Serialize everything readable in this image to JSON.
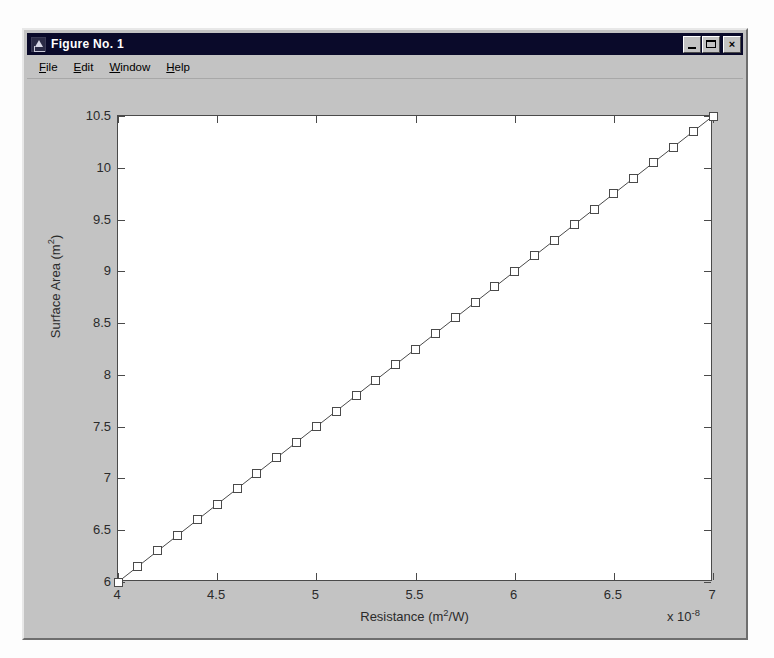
{
  "window": {
    "title": "Figure No. 1",
    "app_icon": "matlab-figure-icon",
    "buttons": {
      "minimize": "minimize-icon",
      "maximize": "maximize-icon",
      "close": "×"
    }
  },
  "menu": {
    "items": [
      {
        "label": "File",
        "mnemonic": "F"
      },
      {
        "label": "Edit",
        "mnemonic": "E"
      },
      {
        "label": "Window",
        "mnemonic": "W"
      },
      {
        "label": "Help",
        "mnemonic": "H"
      }
    ]
  },
  "colors": {
    "window_face": "#c3c3c3",
    "titlebar": "#0a0a2a",
    "titlebar_text": "#ffffff",
    "axes_background": "#ffffff",
    "axes_line": "#4a4a4a",
    "marker_edge": "#4a4a4a",
    "marker_face": "#ffffff",
    "line": "#4a4a4a"
  },
  "chart_data": {
    "type": "line",
    "title": "",
    "xlabel": "Resistance (m²/W)",
    "ylabel": "Surface Area (m²)",
    "x_multiplier": "x 10",
    "x_multiplier_exponent": "-8",
    "xlim": [
      4,
      7
    ],
    "ylim": [
      6,
      10.5
    ],
    "xticks": [
      4,
      4.5,
      5,
      5.5,
      6,
      6.5,
      7
    ],
    "xticklabels": [
      "4",
      "4.5",
      "5",
      "5.5",
      "6",
      "6.5",
      "7"
    ],
    "yticks": [
      6,
      6.5,
      7,
      7.5,
      8,
      8.5,
      9,
      9.5,
      10,
      10.5
    ],
    "yticklabels": [
      "6",
      "6.5",
      "7",
      "7.5",
      "8",
      "8.5",
      "9",
      "9.5",
      "10",
      "10.5"
    ],
    "grid": false,
    "legend": null,
    "marker": "square",
    "series": [
      {
        "name": "Surface Area vs Resistance",
        "x": [
          4.0,
          4.1,
          4.2,
          4.3,
          4.4,
          4.5,
          4.6,
          4.7,
          4.8,
          4.9,
          5.0,
          5.1,
          5.2,
          5.3,
          5.4,
          5.5,
          5.6,
          5.7,
          5.8,
          5.9,
          6.0,
          6.1,
          6.2,
          6.3,
          6.4,
          6.5,
          6.6,
          6.7,
          6.8,
          6.9,
          7.0
        ],
        "y": [
          6.0,
          6.15,
          6.3,
          6.45,
          6.6,
          6.75,
          6.9,
          7.05,
          7.2,
          7.35,
          7.5,
          7.65,
          7.8,
          7.95,
          8.1,
          8.25,
          8.4,
          8.55,
          8.7,
          8.85,
          9.0,
          9.15,
          9.3,
          9.45,
          9.6,
          9.75,
          9.9,
          10.05,
          10.2,
          10.35,
          10.5
        ]
      }
    ]
  }
}
